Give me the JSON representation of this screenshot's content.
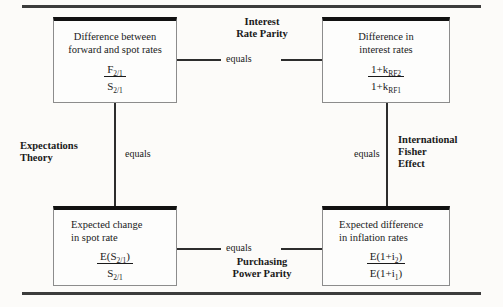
{
  "diagram": {
    "type": "parity-relationships",
    "nodes": [
      {
        "id": "forward-spot",
        "title": "Difference between\nforward and spot rates",
        "formula": {
          "numerator": "F",
          "numerator_sub": "2/1",
          "denominator": "S",
          "denominator_sub": "2/1"
        }
      },
      {
        "id": "interest-rates",
        "title": "Difference in\ninterest rates",
        "formula": {
          "numerator": "1+k",
          "numerator_sub": "RF2",
          "denominator": "1+k",
          "denominator_sub": "RF1"
        }
      },
      {
        "id": "expected-spot",
        "title": "Expected change\nin spot rate",
        "formula": {
          "numerator": "E(S",
          "numerator_sub": "2/1",
          "numerator_tail": ")",
          "denominator": "S",
          "denominator_sub": "2/1",
          "denominator_tail": ""
        }
      },
      {
        "id": "inflation-rates",
        "title": "Expected difference\nin inflation rates",
        "formula": {
          "numerator": "E(1+i",
          "numerator_sub": "2",
          "numerator_tail": ")",
          "denominator": "E(1+i",
          "denominator_sub": "1",
          "denominator_tail": ")"
        }
      }
    ],
    "edges": [
      {
        "id": "interest-rate-parity",
        "name": "Interest\nRate Parity",
        "relation": "equals",
        "from": "forward-spot",
        "to": "interest-rates"
      },
      {
        "id": "expectations-theory",
        "name": "Expectations\nTheory",
        "relation": "equals",
        "from": "forward-spot",
        "to": "expected-spot"
      },
      {
        "id": "international-fisher-effect",
        "name": "International\nFisher\nEffect",
        "relation": "equals",
        "from": "interest-rates",
        "to": "inflation-rates"
      },
      {
        "id": "purchasing-power-parity",
        "name": "Purchasing\nPower Parity",
        "relation": "equals",
        "from": "expected-spot",
        "to": "inflation-rates"
      }
    ],
    "colors": {
      "rule": "#3c3c3c",
      "box_border": "#8c8c8c",
      "box_top_bar": "#111111",
      "connector": "#2d2d2d",
      "text": "#1a1a1a",
      "background": "#fcfbf9"
    }
  }
}
